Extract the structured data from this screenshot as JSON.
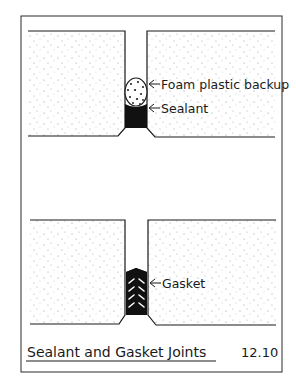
{
  "figure": {
    "caption": "Sealant and Gasket Joints",
    "number": "12.10"
  },
  "top_joint": {
    "labels": {
      "backup": "Foam plastic backup",
      "sealant": "Sealant"
    }
  },
  "bottom_joint": {
    "labels": {
      "gasket": "Gasket"
    }
  },
  "colors": {
    "ink": "#1a1a1a",
    "paper": "#ffffff",
    "stipple": "#8a8a8a"
  }
}
